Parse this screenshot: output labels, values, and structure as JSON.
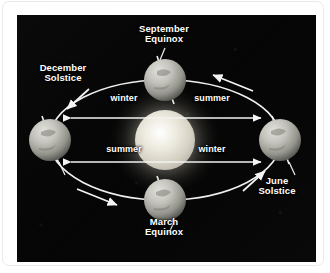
{
  "figure": {
    "kind": "astronomy-diagram",
    "background_color": "#060606",
    "frame_color": "#ffffff",
    "text_color": "#ffffff",
    "orbit_color": "#f2f2f2",
    "sun_color": "#e8e6dc",
    "earth_color": "#b9b9b4"
  },
  "orbit_positions": [
    {
      "id": "september-equinox",
      "label": "September\nEquinox",
      "position": "top"
    },
    {
      "id": "december-solstice",
      "label": "December\nSolstice",
      "position": "left"
    },
    {
      "id": "june-solstice",
      "label": "June\nSolstice",
      "position": "right"
    },
    {
      "id": "march-equinox",
      "label": "March\nEquinox",
      "position": "bottom"
    }
  ],
  "season_labels": [
    {
      "id": "winter-top",
      "text": "winter",
      "hemisphere": "northern",
      "side": "left"
    },
    {
      "id": "summer-top",
      "text": "summer",
      "hemisphere": "northern",
      "side": "right"
    },
    {
      "id": "summer-bottom",
      "text": "summer",
      "hemisphere": "southern",
      "side": "left"
    },
    {
      "id": "winter-bottom",
      "text": "winter",
      "hemisphere": "southern",
      "side": "right"
    }
  ],
  "bodies": {
    "sun": {
      "name": "Sun",
      "cx": 148,
      "cy": 125,
      "r": 30
    },
    "earths": [
      {
        "id": "earth-september",
        "cx": 148,
        "cy": 65,
        "r": 21
      },
      {
        "id": "earth-december",
        "cx": 33,
        "cy": 125,
        "r": 21
      },
      {
        "id": "earth-june",
        "cx": 263,
        "cy": 125,
        "r": 21
      },
      {
        "id": "earth-march",
        "cx": 148,
        "cy": 185,
        "r": 21
      }
    ]
  },
  "orbit": {
    "direction": "counterclockwise",
    "cx": 148,
    "cy": 125,
    "rx": 116,
    "ry": 60
  }
}
